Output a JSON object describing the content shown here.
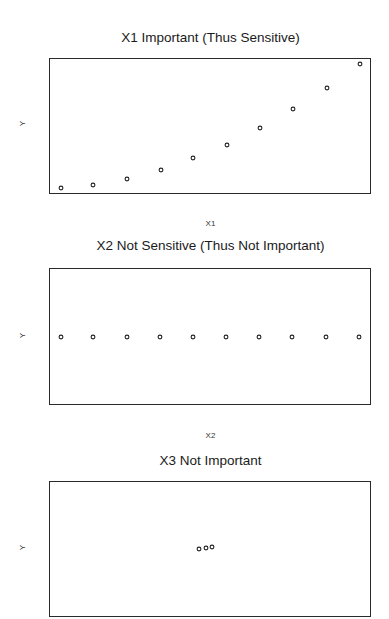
{
  "chart_data": [
    {
      "type": "scatter",
      "title": "X1 Important (Thus Sensitive)",
      "xlabel": "X1",
      "ylabel": "Y",
      "grid": false,
      "axes_ticks": false,
      "x": [
        1,
        2,
        3,
        4,
        5,
        6,
        7,
        8,
        9,
        10
      ],
      "y": [
        1,
        4,
        9,
        16,
        25,
        36,
        49,
        64,
        81,
        100
      ],
      "pixel_points": [
        [
          61,
          188
        ],
        [
          93,
          185
        ],
        [
          127,
          179
        ],
        [
          161,
          170
        ],
        [
          193,
          158
        ],
        [
          227,
          145
        ],
        [
          260,
          128
        ],
        [
          293,
          109
        ],
        [
          327,
          88
        ],
        [
          360,
          64
        ]
      ],
      "box": {
        "top": 58,
        "left": 49,
        "width": 322,
        "height": 136
      },
      "marker": "open-circle"
    },
    {
      "type": "scatter",
      "title": "X2 Not Sensitive (Thus Not Important)",
      "xlabel": "X2",
      "ylabel": "Y",
      "grid": false,
      "axes_ticks": false,
      "x": [
        1,
        2,
        3,
        4,
        5,
        6,
        7,
        8,
        9,
        10
      ],
      "y": [
        50,
        50,
        50,
        50,
        50,
        50,
        50,
        50,
        50,
        50
      ],
      "pixel_points": [
        [
          61,
          337
        ],
        [
          93,
          337
        ],
        [
          127,
          337
        ],
        [
          160,
          337
        ],
        [
          193,
          337
        ],
        [
          226,
          337
        ],
        [
          259,
          337
        ],
        [
          292,
          337
        ],
        [
          326,
          337
        ],
        [
          359,
          337
        ]
      ],
      "box": {
        "top": 268,
        "left": 49,
        "width": 322,
        "height": 137
      },
      "marker": "open-circle"
    },
    {
      "type": "scatter",
      "title": "X3 Not Important",
      "xlabel": "",
      "ylabel": "Y",
      "grid": false,
      "axes_ticks": false,
      "x": [
        4.9,
        5.0,
        5.1
      ],
      "y": [
        49.5,
        50,
        50.5
      ],
      "pixel_points": [
        [
          199,
          549
        ],
        [
          206,
          548
        ],
        [
          212,
          547
        ]
      ],
      "box": {
        "top": 481,
        "left": 49,
        "width": 322,
        "height": 136
      },
      "marker": "open-circle"
    }
  ],
  "panels": [
    {
      "title": "X1 Important (Thus Sensitive)",
      "xlabel": "X1",
      "ylabel": "Y"
    },
    {
      "title": "X2 Not Sensitive (Thus Not Important)",
      "xlabel": "X2",
      "ylabel": "Y"
    },
    {
      "title": "X3 Not Important",
      "xlabel": "",
      "ylabel": "Y"
    }
  ],
  "style": {
    "point_color": "#222222",
    "frame_color": "#2a2a2a",
    "background": "#ffffff"
  }
}
